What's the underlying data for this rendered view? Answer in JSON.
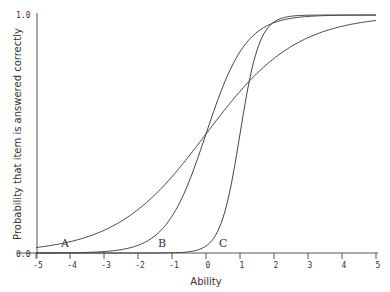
{
  "chart_data": {
    "type": "line",
    "title": "",
    "xlabel": "Ability",
    "ylabel": "Probability that item is answered correctly",
    "xlim": [
      -5,
      5
    ],
    "ylim": [
      0,
      1
    ],
    "x_ticks": [
      "-5",
      "-4",
      "-3",
      "-2",
      "-1",
      "0",
      "1",
      "2",
      "3",
      "4",
      "5"
    ],
    "y_ticks": [
      "0.0",
      "1.0"
    ],
    "grid": false,
    "legend": "none (curves labeled inline)",
    "x": [
      -5,
      -4,
      -3,
      -2,
      -1,
      0,
      1,
      2,
      3,
      4,
      5
    ],
    "series": [
      {
        "name": "A",
        "label": "A",
        "discrimination": 0.75,
        "difficulty": 0.0,
        "values": [
          0.02,
          0.05,
          0.1,
          0.18,
          0.32,
          0.5,
          0.68,
          0.82,
          0.9,
          0.95,
          0.98
        ]
      },
      {
        "name": "B",
        "label": "B",
        "discrimination": 1.7,
        "difficulty": 0.0,
        "values": [
          0.0,
          0.0,
          0.01,
          0.03,
          0.15,
          0.5,
          0.85,
          0.97,
          0.99,
          1.0,
          1.0
        ]
      },
      {
        "name": "C",
        "label": "C",
        "discrimination": 3.5,
        "difficulty": 1.0,
        "values": [
          0.0,
          0.0,
          0.0,
          0.0,
          0.0,
          0.03,
          0.5,
          0.97,
          1.0,
          1.0,
          1.0
        ]
      }
    ],
    "annotations": [
      "A",
      "B",
      "C"
    ]
  },
  "labels": {
    "xlabel": "Ability",
    "ylabel": "Probability that item is answered correctly",
    "ytick_top": "1.0",
    "ytick_bottom": "0.0",
    "curve_a": "A",
    "curve_b": "B",
    "curve_c": "C"
  }
}
